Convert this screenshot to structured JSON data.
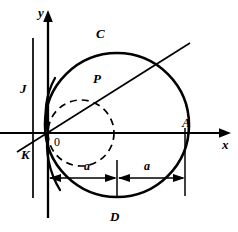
{
  "figure": {
    "kind": "geometry-diagram",
    "width": 238,
    "height": 232,
    "background_color": "#ffffff",
    "stroke_color": "#000000",
    "axes": {
      "x_label": "x",
      "y_label": "y",
      "origin_label": "0",
      "origin_px": [
        48,
        133
      ],
      "x_axis_from_px": [
        0,
        133
      ],
      "x_axis_to_px": [
        228,
        133
      ],
      "y_axis_from_px": [
        48,
        218
      ],
      "y_axis_to_px": [
        48,
        12
      ]
    },
    "points": {
      "A": "A",
      "C": "C",
      "D": "D",
      "J": "J",
      "K": "K",
      "P": "P"
    },
    "point_positions_px": {
      "A": [
        185,
        133
      ],
      "C": [
        117,
        35
      ],
      "D": [
        117,
        213
      ],
      "J": [
        43,
        90
      ],
      "K": [
        43,
        170
      ],
      "P": [
        103,
        88
      ]
    },
    "dimensions": [
      {
        "label": "a",
        "from_px": [
          48,
          178
        ],
        "to_px": [
          117,
          178
        ],
        "text_px": [
          88,
          166
        ]
      },
      {
        "label": "a",
        "from_px": [
          117,
          178
        ],
        "to_px": [
          185,
          178
        ],
        "text_px": [
          147,
          166
        ]
      }
    ],
    "big_circle": {
      "center_px": [
        117,
        125
      ],
      "radius_px": 72,
      "style": "solid"
    },
    "dashed_circle": {
      "center_px": [
        81,
        133
      ],
      "radius_px": 33,
      "style": "dashed"
    },
    "vertical_lines": [
      {
        "x_px": 33,
        "from_y_px": 38,
        "to_y_px": 198
      },
      {
        "x_px": 48,
        "from_y_px": 12,
        "to_y_px": 218
      },
      {
        "x_px": 117,
        "from_y_px": 160,
        "to_y_px": 196
      },
      {
        "x_px": 185,
        "from_y_px": 128,
        "to_y_px": 196
      }
    ],
    "diagonal_line": {
      "from_px": [
        17,
        152
      ],
      "to_px": [
        190,
        43
      ]
    }
  }
}
